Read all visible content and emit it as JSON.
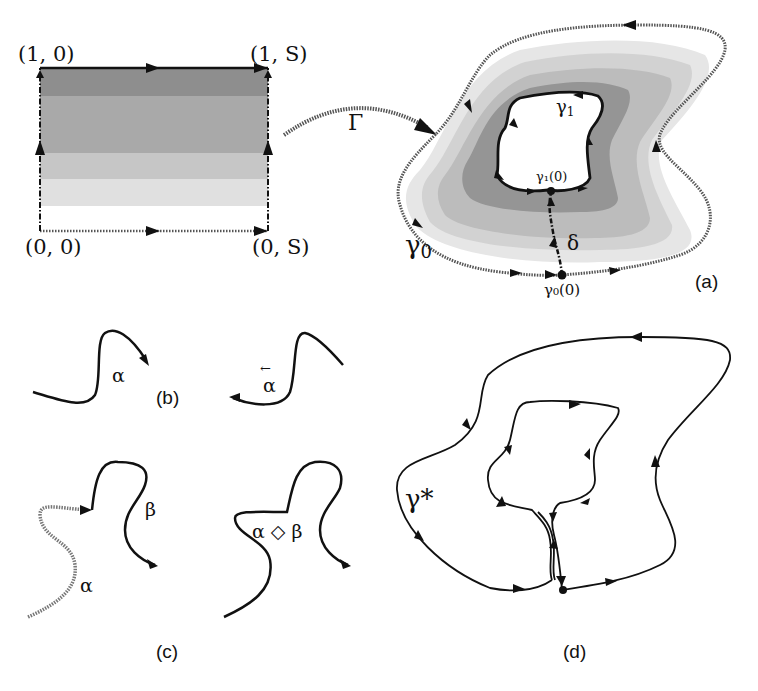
{
  "figure": {
    "panels": {
      "a": {
        "label": "(a)",
        "rectangle": {
          "corners": {
            "top_left": "(1, 0)",
            "top_right": "(1, S)",
            "bottom_left": "(0, 0)",
            "bottom_right": "(0, S)"
          }
        },
        "map_label": "Γ",
        "outer_curve_label": "γ",
        "outer_curve_subscript": "0",
        "inner_curve_label": "γ",
        "inner_curve_subscript": "1",
        "inner_point_label": "γ₁(0)",
        "outer_point_label": "γ₀(0)",
        "connector_label": "δ"
      },
      "b": {
        "label": "(b)",
        "curve_label": "α",
        "reversed_curve_label": "α",
        "reversed_bar": "←"
      },
      "c": {
        "label": "(c)",
        "alpha_label": "α",
        "beta_label": "β",
        "concat_label": "α ◇ β"
      },
      "d": {
        "label": "(d)",
        "curve_label": "γ*"
      }
    },
    "colors": {
      "band_darkest": "#8a8a8a",
      "band_dark": "#a6a6a6",
      "band_mid": "#bdbdbd",
      "band_light": "#d6d6d6",
      "band_lightest": "#e8e8e8",
      "line": "#111111",
      "dotted_line": "#6a6a6a"
    }
  }
}
